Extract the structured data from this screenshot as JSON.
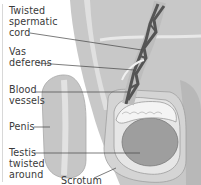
{
  "diagram": {
    "labels": {
      "twisted_spermatic_cord": "Twisted\nspermatic\ncord",
      "vas_deferens": "Vas\ndeferens",
      "blood_vessels": "Blood\nvessels",
      "penis": "Penis",
      "testis_twisted_around": "Testis\ntwisted\naround",
      "scrotum": "Scrotum"
    },
    "colors": {
      "background": "#ffffff",
      "body_tissue": "#c4c4c4",
      "skin_light": "#d6d6d6",
      "cord_dark": "#555555",
      "testis": "#9a9a9a",
      "epididymis": "#f0f0f0",
      "leader_line": "#444444",
      "text": "#3a3a3a"
    }
  }
}
